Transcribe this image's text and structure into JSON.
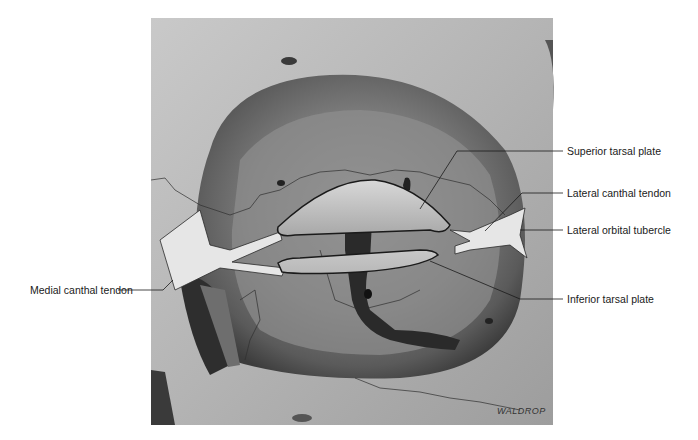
{
  "figure": {
    "labels": {
      "superior_tarsal_plate": "Superior tarsal plate",
      "lateral_canthal_tendon": "Lateral canthal tendon",
      "lateral_orbital_tubercle": "Lateral orbital tubercle",
      "inferior_tarsal_plate": "Inferior tarsal plate",
      "medial_canthal_tendon": "Medial canthal tendon"
    },
    "signature": "WALDROP"
  }
}
